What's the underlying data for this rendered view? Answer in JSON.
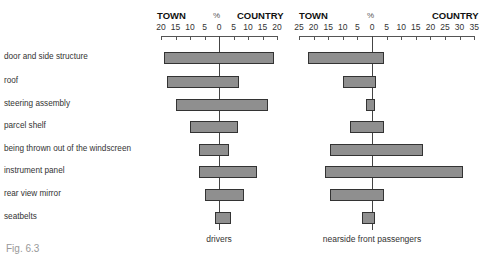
{
  "chart_data": [
    {
      "type": "bar",
      "orientation": "horizontal-diverging",
      "title": "drivers",
      "xlabel": "%",
      "left_label": "TOWN",
      "right_label": "COUNTRY",
      "ticks_left": [
        20,
        15,
        10,
        5
      ],
      "ticks_right": [
        0,
        5,
        10,
        15,
        20
      ],
      "xlim": [
        -20,
        20
      ],
      "categories": [
        "door and side structure",
        "roof",
        "steering assembly",
        "parcel shelf",
        "being thrown out of the windscreen",
        "instrument panel",
        "rear view mirror",
        "seatbelts"
      ],
      "series": [
        {
          "name": "TOWN",
          "values": [
            19,
            18,
            15,
            10,
            7,
            7,
            5,
            1.5
          ]
        },
        {
          "name": "COUNTRY",
          "values": [
            19,
            7,
            17,
            6.5,
            3.5,
            13,
            8.5,
            4
          ]
        }
      ]
    },
    {
      "type": "bar",
      "orientation": "horizontal-diverging",
      "title": "nearside front passengers",
      "xlabel": "%",
      "left_label": "TOWN",
      "right_label": "COUNTRY",
      "ticks_left": [
        25,
        20,
        15,
        10,
        5
      ],
      "ticks_right": [
        0,
        5,
        10,
        15,
        20,
        25,
        30,
        35
      ],
      "xlim": [
        -25,
        35
      ],
      "categories": [
        "door and side structure",
        "roof",
        "steering assembly",
        "parcel shelf",
        "being thrown out of the windscreen",
        "instrument panel",
        "rear view mirror",
        "seatbelts"
      ],
      "series": [
        {
          "name": "TOWN",
          "values": [
            22,
            10,
            2,
            7.5,
            14.5,
            16,
            14.5,
            3.5
          ]
        },
        {
          "name": "COUNTRY",
          "values": [
            4,
            1.5,
            1,
            4,
            17.5,
            31,
            4,
            1
          ]
        }
      ]
    }
  ],
  "labels": {
    "town": "TOWN",
    "country": "COUNTRY",
    "pct": "%",
    "drivers": "drivers",
    "passengers": "nearside front passengers",
    "figure": "Fig. 6.3"
  },
  "colors": {
    "bar_fill": "#8f8f8f",
    "bar_border": "#333333"
  }
}
